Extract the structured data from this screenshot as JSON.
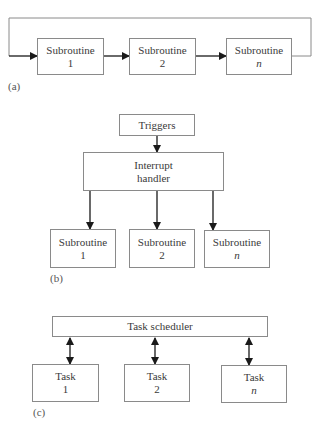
{
  "panel_a": {
    "label": "(a)",
    "boxes": [
      {
        "line1": "Subroutine",
        "line2": "1"
      },
      {
        "line1": "Subroutine",
        "line2": "2"
      },
      {
        "line1": "Subroutine",
        "line2": "n"
      }
    ]
  },
  "panel_b": {
    "label": "(b)",
    "triggers": "Triggers",
    "handler": {
      "line1": "Interrupt",
      "line2": "handler"
    },
    "boxes": [
      {
        "line1": "Subroutine",
        "line2": "1"
      },
      {
        "line1": "Subroutine",
        "line2": "2"
      },
      {
        "line1": "Subroutine",
        "line2": "n"
      }
    ]
  },
  "panel_c": {
    "label": "(c)",
    "scheduler": "Task scheduler",
    "boxes": [
      {
        "line1": "Task",
        "line2": "1"
      },
      {
        "line1": "Task",
        "line2": "2"
      },
      {
        "line1": "Task",
        "line2": "n"
      }
    ]
  },
  "colors": {
    "line": "#1a1a1a",
    "box_border": "#8a8a8a",
    "text": "#3a3a3a"
  }
}
